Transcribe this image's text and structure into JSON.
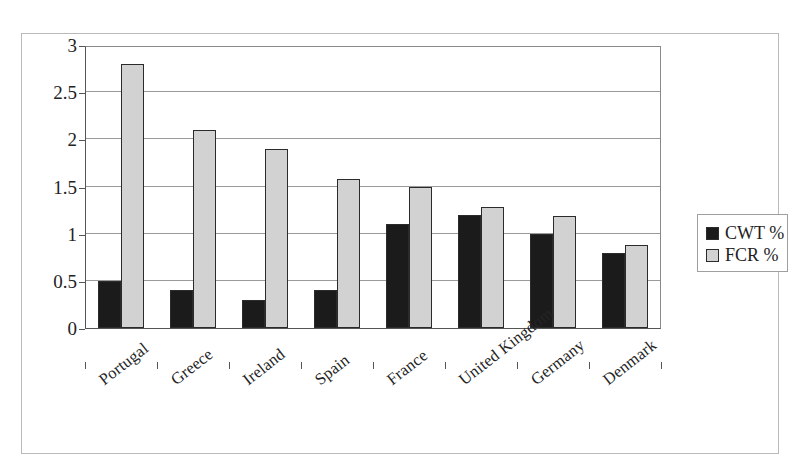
{
  "chart_data": {
    "type": "bar",
    "title": "",
    "xlabel": "",
    "ylabel": "",
    "ylim": [
      0,
      3
    ],
    "y_ticks": [
      "0",
      "0.5",
      "1",
      "1.5",
      "2",
      "2.5",
      "3"
    ],
    "y_tick_values": [
      0,
      0.5,
      1,
      1.5,
      2,
      2.5,
      3
    ],
    "grid": true,
    "legend_position": "right",
    "categories": [
      "Portugal",
      "Greece",
      "Ireland",
      "Spain",
      "France",
      "United Kingdom",
      "Germany",
      "Denmark"
    ],
    "series": [
      {
        "name": "CWT %",
        "color": "#1b1b1b",
        "values": [
          0.5,
          0.4,
          0.3,
          0.4,
          1.1,
          1.2,
          1.0,
          0.8
        ]
      },
      {
        "name": "FCR %",
        "color": "#d2d2d2",
        "values": [
          2.8,
          2.1,
          1.9,
          1.58,
          1.5,
          1.28,
          1.19,
          0.88
        ]
      }
    ]
  },
  "legend": {
    "items": [
      {
        "label": "CWT %",
        "color": "#1b1b1b"
      },
      {
        "label": "FCR %",
        "color": "#d2d2d2"
      }
    ]
  }
}
